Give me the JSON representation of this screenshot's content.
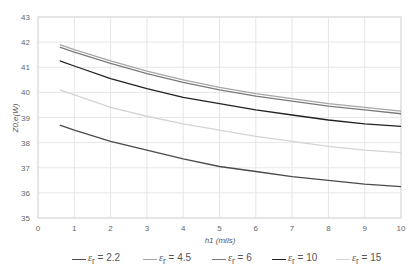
{
  "chart_data": {
    "type": "line",
    "title": "",
    "xlabel": "h1 (mils)",
    "ylabel": "Z0,e(W)",
    "xlim": [
      0,
      10
    ],
    "ylim": [
      35,
      43
    ],
    "x_ticks": [
      0,
      1,
      2,
      3,
      4,
      5,
      6,
      7,
      8,
      9,
      10
    ],
    "y_ticks": [
      35,
      36,
      37,
      38,
      39,
      40,
      41,
      42,
      43
    ],
    "grid": true,
    "legend_position": "bottom",
    "x": [
      0.6,
      1,
      2,
      3,
      4,
      5,
      6,
      7,
      8,
      9,
      10
    ],
    "series": [
      {
        "name": "εr = 2.2",
        "color": "#4a4a4a",
        "values": [
          38.7,
          38.5,
          38.05,
          37.7,
          37.35,
          37.05,
          36.85,
          36.65,
          36.5,
          36.35,
          36.25
        ]
      },
      {
        "name": "εr = 4.5",
        "color": "#a6a6a6",
        "values": [
          41.9,
          41.7,
          41.25,
          40.85,
          40.5,
          40.2,
          39.95,
          39.75,
          39.55,
          39.4,
          39.25
        ]
      },
      {
        "name": "εr = 6",
        "color": "#7a7a7a",
        "values": [
          41.8,
          41.6,
          41.15,
          40.75,
          40.4,
          40.1,
          39.85,
          39.65,
          39.45,
          39.3,
          39.15
        ]
      },
      {
        "name": "εr = 10",
        "color": "#222222",
        "values": [
          41.25,
          41.05,
          40.55,
          40.15,
          39.8,
          39.55,
          39.3,
          39.1,
          38.9,
          38.75,
          38.65
        ]
      },
      {
        "name": "εr = 15",
        "color": "#d4d4d4",
        "values": [
          40.1,
          39.9,
          39.4,
          39.05,
          38.75,
          38.5,
          38.25,
          38.05,
          37.85,
          37.7,
          37.6
        ]
      }
    ]
  },
  "legend": {
    "items": [
      {
        "label": "= 2.2",
        "symbol": "ε",
        "sub": "r"
      },
      {
        "label": "= 4.5",
        "symbol": "ε",
        "sub": "r"
      },
      {
        "label": "= 6",
        "symbol": "ε",
        "sub": "r"
      },
      {
        "label": "= 10",
        "symbol": "ε",
        "sub": "r"
      },
      {
        "label": "= 15",
        "symbol": "ε",
        "sub": "r"
      }
    ]
  }
}
